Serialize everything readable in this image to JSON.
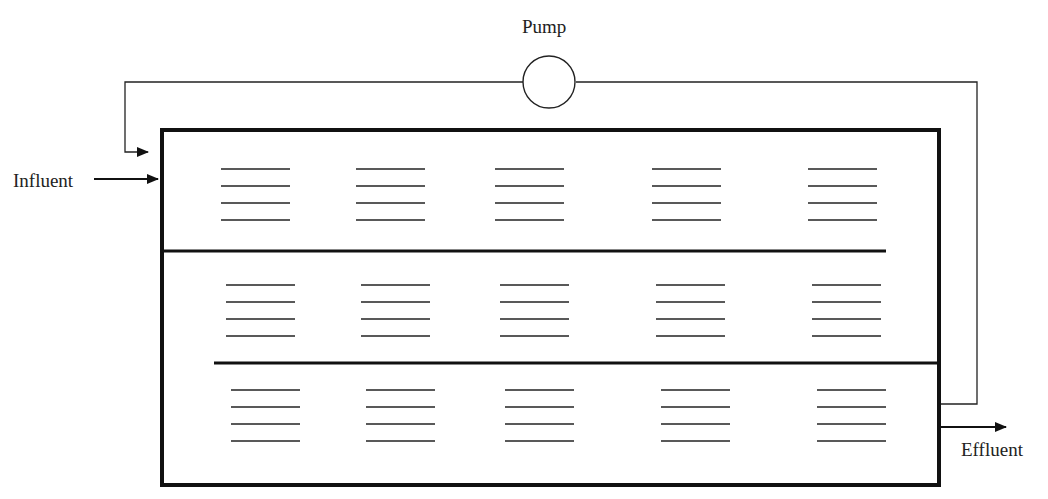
{
  "labels": {
    "pump": "Pump",
    "influent": "Influent",
    "effluent": "Effluent"
  },
  "tank": {
    "compartments": 3,
    "media_groups_per_compartment": 5,
    "lines_per_group": 4
  },
  "colors": {
    "stroke": "#111111",
    "background": "#ffffff"
  }
}
